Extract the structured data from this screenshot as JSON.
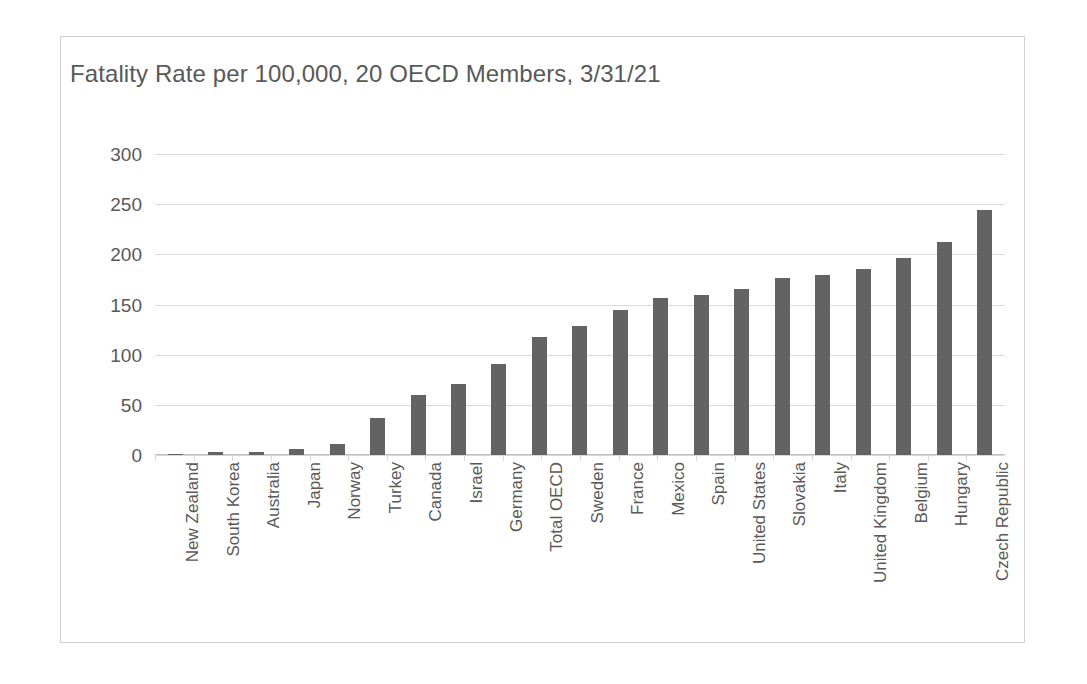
{
  "chart_data": {
    "type": "bar",
    "title": "Fatality Rate per 100,000, 20 OECD Members, 3/31/21",
    "xlabel": "",
    "ylabel": "",
    "ylim": [
      0,
      300
    ],
    "yticks": [
      300,
      250,
      200,
      150,
      100,
      50,
      0
    ],
    "grid": true,
    "legend": "none",
    "bar_color": "#636363",
    "gridline_color": "#d9d9d9",
    "text_color": "#595959",
    "orientation": "vertical",
    "categories": [
      "New Zealand",
      "South Korea",
      "Australia",
      "Japan",
      "Norway",
      "Turkey",
      "Canada",
      "Israel",
      "Germany",
      "Total OECD",
      "Sweden",
      "France",
      "Mexico",
      "Spain",
      "United States",
      "Slovakia",
      "Italy",
      "United Kingdom",
      "Belgium",
      "Hungary",
      "Czech Republic"
    ],
    "values": [
      1,
      3,
      3,
      6,
      11,
      37,
      60,
      71,
      91,
      118,
      129,
      145,
      156,
      159,
      165,
      176,
      179,
      185,
      196,
      212,
      244
    ]
  }
}
